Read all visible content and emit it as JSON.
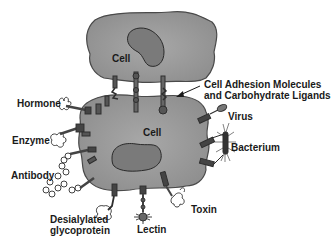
{
  "figure": {
    "cells": [
      {
        "label": "Cell",
        "role": "top-cell"
      },
      {
        "label": "Cell",
        "role": "bottom-cell"
      }
    ],
    "labels": {
      "hormone": "Hormone",
      "enzyme": "Enzyme",
      "antibody": "Antibody",
      "desialylated": "Desialylated\nglycoprotein",
      "lectin": "Lectin",
      "toxin": "Toxin",
      "bacterium": "Bacterium",
      "virus": "Virus",
      "cam_line1": "Cell Adhesion Molecules",
      "cam_line2": "and Carbohydrate Ligands"
    },
    "colors": {
      "cytoplasm": "#9a9a9a",
      "cell_outline": "#4a4a4a",
      "nucleus": "#7a7a7a",
      "nucleus_outline": "#2a2a2a",
      "molecule": "#3a3a3a",
      "text": "#1a1a1a",
      "background": "#ffffff"
    }
  }
}
